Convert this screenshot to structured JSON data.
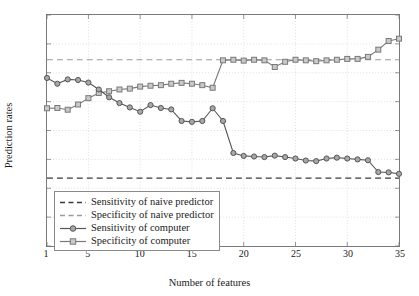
{
  "chart_data": {
    "type": "line",
    "title": "",
    "xlabel": "Number of features",
    "ylabel": "Prediction rates",
    "xlim": [
      1,
      35
    ],
    "ylim": [
      0.2,
      1
    ],
    "xticks": [
      1,
      5,
      10,
      15,
      20,
      25,
      30,
      35
    ],
    "xtick_labels": [
      "1",
      "5",
      "10",
      "15",
      "20",
      "25",
      "30",
      "35"
    ],
    "yticks": [
      0.2,
      0.3,
      0.4,
      0.5,
      0.6,
      0.7,
      0.8,
      0.9,
      1
    ],
    "ytick_labels": [
      "0.2",
      "0.3",
      "0.4",
      "0.5",
      "0.6",
      "0.7",
      "0.8",
      "0.9",
      "1"
    ],
    "grid": true,
    "legend_position": "lower left",
    "x": [
      1,
      2,
      3,
      4,
      5,
      6,
      7,
      8,
      9,
      10,
      11,
      12,
      13,
      14,
      15,
      16,
      17,
      18,
      19,
      20,
      21,
      22,
      23,
      24,
      25,
      26,
      27,
      28,
      29,
      30,
      31,
      32,
      33,
      34,
      35
    ],
    "series": [
      {
        "name": "Sensitivity of naive predictor",
        "style": "dashed",
        "color": "#3a3a3a",
        "constant": 0.435
      },
      {
        "name": "Specificity of naive predictor",
        "style": "dashed",
        "color": "#9a9a9a",
        "constant": 0.845
      },
      {
        "name": "Sensitivity of computer",
        "style": "solid-circle",
        "color": "#555555",
        "values": [
          0.782,
          0.762,
          0.777,
          0.775,
          0.766,
          0.742,
          0.715,
          0.695,
          0.68,
          0.665,
          0.688,
          0.678,
          0.673,
          0.633,
          0.63,
          0.633,
          0.677,
          0.633,
          0.522,
          0.512,
          0.51,
          0.508,
          0.513,
          0.508,
          0.503,
          0.496,
          0.494,
          0.503,
          0.506,
          0.503,
          0.5,
          0.497,
          0.456,
          0.455,
          0.45
        ]
      },
      {
        "name": "Specificity of computer",
        "style": "solid-square",
        "color": "#787878",
        "values": [
          0.677,
          0.678,
          0.672,
          0.69,
          0.712,
          0.73,
          0.736,
          0.742,
          0.745,
          0.752,
          0.755,
          0.757,
          0.762,
          0.765,
          0.762,
          0.757,
          0.748,
          0.843,
          0.845,
          0.842,
          0.845,
          0.843,
          0.82,
          0.838,
          0.845,
          0.843,
          0.84,
          0.843,
          0.845,
          0.848,
          0.848,
          0.855,
          0.88,
          0.91,
          0.918
        ]
      }
    ],
    "annotations": []
  },
  "series_render": {
    "sensitivity_computer": [
      [
        1,
        0.782
      ],
      [
        2,
        0.762
      ],
      [
        3,
        0.777
      ],
      [
        4,
        0.775
      ],
      [
        5,
        0.766
      ],
      [
        6,
        0.742
      ],
      [
        7,
        0.715
      ],
      [
        8,
        0.695
      ],
      [
        9,
        0.68
      ],
      [
        10,
        0.665
      ],
      [
        11,
        0.688
      ],
      [
        12,
        0.678
      ],
      [
        13,
        0.673
      ],
      [
        14,
        0.633
      ],
      [
        15,
        0.63
      ],
      [
        16,
        0.633
      ],
      [
        17,
        0.677
      ],
      [
        18,
        0.633
      ],
      [
        19,
        0.522
      ],
      [
        20,
        0.512
      ],
      [
        21,
        0.51
      ],
      [
        22,
        0.508
      ],
      [
        23,
        0.513
      ],
      [
        24,
        0.508
      ],
      [
        25,
        0.503
      ],
      [
        26,
        0.496
      ],
      [
        27,
        0.494
      ],
      [
        28,
        0.503
      ],
      [
        29,
        0.506
      ],
      [
        30,
        0.503
      ],
      [
        31,
        0.5
      ],
      [
        32,
        0.497
      ],
      [
        33,
        0.456
      ],
      [
        34,
        0.455
      ],
      [
        35,
        0.45
      ]
    ],
    "specificity_computer": [
      [
        1,
        0.677
      ],
      [
        2,
        0.678
      ],
      [
        3,
        0.672
      ],
      [
        4,
        0.69
      ],
      [
        5,
        0.712
      ],
      [
        6,
        0.73
      ],
      [
        7,
        0.736
      ],
      [
        8,
        0.742
      ],
      [
        9,
        0.745
      ],
      [
        10,
        0.752
      ],
      [
        11,
        0.755
      ],
      [
        12,
        0.757
      ],
      [
        13,
        0.762
      ],
      [
        14,
        0.765
      ],
      [
        15,
        0.762
      ],
      [
        16,
        0.757
      ],
      [
        17,
        0.748
      ],
      [
        18,
        0.843
      ],
      [
        19,
        0.845
      ],
      [
        20,
        0.842
      ],
      [
        21,
        0.845
      ],
      [
        22,
        0.843
      ],
      [
        23,
        0.82
      ],
      [
        24,
        0.838
      ],
      [
        25,
        0.845
      ],
      [
        26,
        0.843
      ],
      [
        27,
        0.84
      ],
      [
        28,
        0.843
      ],
      [
        29,
        0.845
      ],
      [
        30,
        0.848
      ],
      [
        31,
        0.848
      ],
      [
        32,
        0.855
      ],
      [
        33,
        0.88
      ],
      [
        34,
        0.91
      ],
      [
        35,
        0.918
      ]
    ]
  },
  "legend": {
    "items": [
      {
        "label": "Sensitivity of naive predictor",
        "key": "dash-dark"
      },
      {
        "label": "Specificity of naive predictor",
        "key": "dash-light"
      },
      {
        "label": "Sensitivity of computer",
        "key": "line-circle"
      },
      {
        "label": "Specificity of computer",
        "key": "line-square"
      }
    ]
  }
}
